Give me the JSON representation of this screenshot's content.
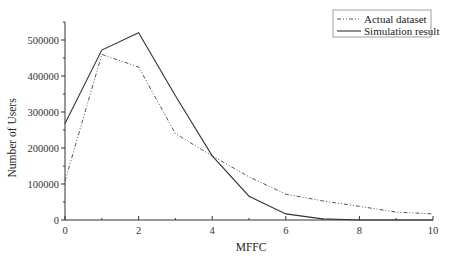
{
  "chart_data": {
    "type": "line",
    "title": "",
    "xlabel": "MFFC",
    "ylabel": "Number of Users",
    "xlim": [
      0,
      10
    ],
    "ylim": [
      0,
      550000
    ],
    "x_ticks": [
      0,
      2,
      4,
      6,
      8,
      10
    ],
    "y_ticks": [
      0,
      100000,
      200000,
      300000,
      400000,
      500000
    ],
    "x_tick_labels": [
      "0",
      "2",
      "4",
      "6",
      "8",
      "10"
    ],
    "y_tick_labels": [
      "0",
      "100000",
      "200000",
      "300000",
      "400000",
      "500000"
    ],
    "grid": false,
    "legend_position": "upper right",
    "x": [
      0,
      1,
      2,
      3,
      4,
      5,
      6,
      7,
      8,
      9,
      10
    ],
    "series": [
      {
        "name": "Actual dataset",
        "style": "dash-dot-dot",
        "color": "#555555",
        "values": [
          108000,
          460000,
          425000,
          240000,
          178000,
          120000,
          72000,
          53000,
          38000,
          22000,
          17000
        ]
      },
      {
        "name": "Simulation result",
        "style": "solid",
        "color": "#333333",
        "values": [
          268000,
          472000,
          520000,
          345000,
          178000,
          66000,
          17000,
          3000,
          0,
          0,
          0
        ]
      }
    ]
  }
}
